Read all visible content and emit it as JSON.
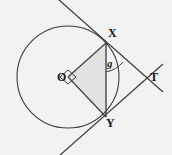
{
  "figure": {
    "background_color": "#f2f2f2",
    "stroke_color": "#3a3a3a",
    "shade_color": "#e2e2e2",
    "label_color": "#1a1a1a",
    "width": 172,
    "height": 155,
    "circle": {
      "center_x": 68,
      "center_y": 77,
      "radius": 51
    },
    "points": {
      "O": {
        "x": 68,
        "y": 77,
        "label": "O",
        "label_x": 57,
        "label_y": 71
      },
      "X": {
        "x": 106,
        "y": 43,
        "label": "X",
        "label_x": 108,
        "label_y": 27
      },
      "Y": {
        "x": 106,
        "y": 117,
        "label": "Y",
        "label_x": 106,
        "label_y": 116
      },
      "T": {
        "x": 145,
        "y": 78,
        "label": "T",
        "label_x": 150,
        "label_y": 71
      }
    },
    "angle_marks": [
      {
        "name": "right-angle-at-O",
        "label": "",
        "vertex_x": 68,
        "vertex_y": 77
      },
      {
        "name": "angle-g-at-X",
        "label": "g",
        "label_x": 107,
        "label_y": 58
      }
    ],
    "tangent_lines": [
      {
        "name": "tangent-through-X",
        "from_x": 50,
        "from_y": -8,
        "to_x": 163,
        "to_y": 92
      },
      {
        "name": "tangent-through-Y",
        "from_x": 50,
        "from_y": 164,
        "to_x": 163,
        "to_y": 64
      }
    ],
    "chord": {
      "name": "chord-XY",
      "x1": 106,
      "y1": 43,
      "x2": 106,
      "y2": 117
    },
    "radii": [
      {
        "name": "radius-OX",
        "x1": 68,
        "y1": 77,
        "x2": 106,
        "y2": 43
      },
      {
        "name": "radius-OY",
        "x1": 68,
        "y1": 77,
        "x2": 106,
        "y2": 117
      }
    ],
    "shaded_region": {
      "name": "triangle-OXY",
      "vertices": "68,77 106,43 106,117"
    }
  }
}
